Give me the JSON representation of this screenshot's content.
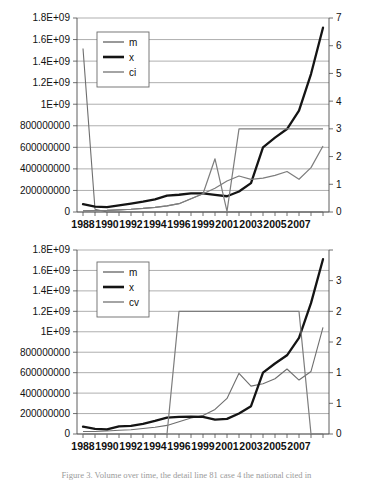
{
  "figure": {
    "caption": "Figure 3. Volume over time, the detail line 81 case 4 the national cited in"
  },
  "chart_data": [
    {
      "id": "top",
      "type": "line",
      "title": "",
      "xlabel": "",
      "ylabel": "",
      "grid": true,
      "legend_position": "top-left",
      "x": [
        1988,
        1989,
        1990,
        1991,
        1992,
        1993,
        1994,
        1995,
        1996,
        1997,
        1998,
        1999,
        2000,
        2001,
        2002,
        2003,
        2004,
        2005,
        2006,
        2007,
        2008
      ],
      "xtick_labels": [
        "1988",
        "1990",
        "1992",
        "1994",
        "1996",
        "1999",
        "2001",
        "2003",
        "2005",
        "2007"
      ],
      "xtick_values": [
        1988,
        1990,
        1992,
        1994,
        1996,
        1998,
        2000,
        2002,
        2004,
        2006
      ],
      "xlim": [
        1987.5,
        2008.5
      ],
      "left_axis": {
        "label": "",
        "lim": [
          0,
          1800000000
        ],
        "tick_values": [
          0,
          200000000,
          400000000,
          600000000,
          800000000,
          1000000000,
          1200000000,
          1400000000,
          1600000000,
          1800000000
        ],
        "tick_labels": [
          "0",
          "200000000",
          "400000000",
          "600000000",
          "800000000",
          "1E+09",
          "1.2E+09",
          "1.4E+09",
          "1.6E+09",
          "1.8E+09"
        ]
      },
      "right_axis": {
        "label": "",
        "lim": [
          0,
          7
        ],
        "tick_values": [
          0,
          1,
          2,
          3,
          4,
          5,
          6,
          7
        ],
        "tick_labels": [
          "0",
          "1",
          "2",
          "3",
          "4",
          "5",
          "6",
          "7"
        ]
      },
      "series": [
        {
          "name": "m",
          "axis": "right",
          "color": "#6e6e6e",
          "values": [
            5.9,
            0.1,
            0.0,
            0.0,
            0.0,
            0.0,
            0.0,
            0.0,
            0.0,
            0.0,
            0.0,
            0.0,
            0.0,
            0.0,
            0.0,
            0.0,
            0.0,
            0.0,
            0.0,
            0.0,
            0.0
          ]
        },
        {
          "name": "x",
          "axis": "left",
          "color": "#141414",
          "values": [
            72000000,
            50000000,
            46000000,
            62000000,
            78000000,
            96000000,
            118000000,
            152000000,
            160000000,
            172000000,
            172000000,
            158000000,
            146000000,
            190000000,
            268000000,
            600000000,
            690000000,
            770000000,
            940000000,
            1280000000,
            1710000000
          ]
        },
        {
          "name": "ci",
          "axis": "right",
          "color": "#7d7d7d",
          "values": [
            0.04,
            0.05,
            0.06,
            0.08,
            0.1,
            0.13,
            0.17,
            0.22,
            0.3,
            0.48,
            0.66,
            1.92,
            0.02,
            3.0,
            3.0,
            3.0,
            3.0,
            3.0,
            3.0,
            3.0,
            3.0
          ]
        },
        {
          "name": "ci-secondary",
          "axis": "right",
          "color": "#7d7d7d",
          "values": [
            0.04,
            0.05,
            0.06,
            0.08,
            0.1,
            0.13,
            0.17,
            0.22,
            0.3,
            0.48,
            0.66,
            0.86,
            1.12,
            1.3,
            1.18,
            1.22,
            1.32,
            1.46,
            1.18,
            1.6,
            2.38
          ]
        }
      ],
      "legend": [
        "m",
        "x",
        "ci"
      ]
    },
    {
      "id": "bottom",
      "type": "line",
      "title": "",
      "xlabel": "",
      "ylabel": "",
      "grid": true,
      "legend_position": "top-left",
      "x": [
        1988,
        1989,
        1990,
        1991,
        1992,
        1993,
        1994,
        1995,
        1996,
        1997,
        1998,
        1999,
        2000,
        2001,
        2002,
        2003,
        2004,
        2005,
        2006,
        2007,
        2008
      ],
      "xtick_labels": [
        "1988",
        "1990",
        "1992",
        "1994",
        "1996",
        "1999",
        "2001",
        "2003",
        "2005",
        "2007"
      ],
      "xtick_values": [
        1988,
        1990,
        1992,
        1994,
        1996,
        1998,
        2000,
        2002,
        2004,
        2006
      ],
      "xlim": [
        1987.5,
        2008.5
      ],
      "left_axis": {
        "label": "",
        "lim": [
          0,
          1800000000
        ],
        "tick_values": [
          0,
          200000000,
          400000000,
          600000000,
          800000000,
          1000000000,
          1200000000,
          1400000000,
          1600000000,
          1800000000
        ],
        "tick_labels": [
          "0",
          "200000000",
          "400000000",
          "600000000",
          "800000000",
          "1E+09",
          "1.2E+09",
          "1.4E+09",
          "1.6E+09",
          "1.8E+09"
        ]
      },
      "right_axis": {
        "label": "",
        "lim": [
          0,
          3
        ],
        "tick_values": [
          0,
          0.5,
          1,
          1.5,
          2,
          2.5,
          3
        ],
        "tick_labels": [
          "0",
          "1",
          "1",
          "2",
          "2",
          "3"
        ]
      },
      "series": [
        {
          "name": "m",
          "axis": "right",
          "color": "#6e6e6e",
          "values": [
            0.04,
            0.04,
            0.05,
            0.06,
            0.07,
            0.09,
            0.11,
            0.14,
            0.2,
            0.26,
            0.3,
            0.4,
            0.58,
            0.99,
            0.78,
            0.82,
            0.9,
            1.06,
            0.88,
            1.02,
            1.74
          ]
        },
        {
          "name": "x",
          "axis": "left",
          "color": "#141414",
          "values": [
            72000000,
            50000000,
            46000000,
            74000000,
            80000000,
            100000000,
            128000000,
            160000000,
            168000000,
            170000000,
            168000000,
            140000000,
            148000000,
            200000000,
            272000000,
            600000000,
            690000000,
            770000000,
            940000000,
            1280000000,
            1710000000
          ]
        },
        {
          "name": "cv",
          "axis": "right",
          "color": "#7d7d7d",
          "values": [
            0.0,
            0.0,
            0.0,
            0.0,
            0.0,
            0.0,
            0.0,
            0.0,
            2.0,
            2.0,
            2.0,
            2.0,
            2.0,
            2.0,
            2.0,
            2.0,
            2.0,
            2.0,
            2.0,
            0.0,
            0.0
          ]
        }
      ],
      "legend": [
        "m",
        "x",
        "cv"
      ]
    }
  ]
}
